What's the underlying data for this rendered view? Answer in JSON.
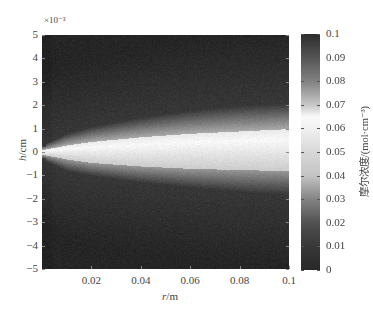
{
  "chart_data": {
    "type": "heatmap",
    "title": "",
    "xlabel": "r/m",
    "xlabel_italic": "r",
    "xlabel_unit": "/m",
    "ylabel": "h/cm",
    "ylabel_italic": "h",
    "ylabel_unit": "/cm",
    "y_exponent": "×10⁻³",
    "xlim": [
      0,
      0.1
    ],
    "ylim": [
      -5,
      5
    ],
    "xticks": [
      0.02,
      0.04,
      0.06,
      0.08,
      0.1
    ],
    "xtick_labels": [
      "0.02",
      "0.04",
      "0.06",
      "0.08",
      "0.1"
    ],
    "yticks": [
      5,
      4,
      3,
      2,
      1,
      0,
      -1,
      -2,
      -3,
      -4,
      -5
    ],
    "ytick_labels": [
      "5",
      "4",
      "3",
      "2",
      "1",
      "0",
      "−1",
      "−2",
      "−3",
      "−4",
      "−5"
    ],
    "colorbar": {
      "label": "摩尔浓度/(mol·cm⁻³)",
      "range": [
        0,
        0.1
      ],
      "ticks": [
        0.1,
        0.09,
        0.08,
        0.07,
        0.06,
        0.05,
        0.04,
        0.03,
        0.02,
        0.01,
        0
      ],
      "tick_labels": [
        "0.1",
        "0.09",
        "0.08",
        "0.07",
        "0.06",
        "0.05",
        "0.04",
        "0.03",
        "0.02",
        "0.01",
        "0"
      ],
      "gray_levels": [
        {
          "value": 0.0,
          "gray": 40
        },
        {
          "value": 0.01,
          "gray": 55
        },
        {
          "value": 0.02,
          "gray": 80
        },
        {
          "value": 0.03,
          "gray": 130
        },
        {
          "value": 0.04,
          "gray": 195
        },
        {
          "value": 0.05,
          "gray": 215
        },
        {
          "value": 0.06,
          "gray": 240
        },
        {
          "value": 0.065,
          "gray": 250
        },
        {
          "value": 0.07,
          "gray": 200
        },
        {
          "value": 0.08,
          "gray": 130
        },
        {
          "value": 0.09,
          "gray": 85
        },
        {
          "value": 0.1,
          "gray": 45
        }
      ]
    },
    "field_description": "Concentration plume emanating from origin (r=0, h=0), widening with r; bright core ~h in [-0.8, +1] at r=0.1, gray halo ~h in [-1.8, +2]",
    "plume_profile": {
      "r": [
        0.0,
        0.01,
        0.02,
        0.04,
        0.06,
        0.08,
        0.1
      ],
      "core_top_h": [
        0.1,
        0.3,
        0.45,
        0.65,
        0.8,
        0.9,
        1.0
      ],
      "core_bottom_h": [
        -0.1,
        -0.3,
        -0.45,
        -0.6,
        -0.7,
        -0.75,
        -0.8
      ],
      "halo_top_h": [
        0.3,
        0.8,
        1.1,
        1.5,
        1.8,
        2.0,
        2.1
      ],
      "halo_bottom_h": [
        -0.3,
        -0.8,
        -1.0,
        -1.3,
        -1.5,
        -1.7,
        -1.8
      ]
    }
  }
}
